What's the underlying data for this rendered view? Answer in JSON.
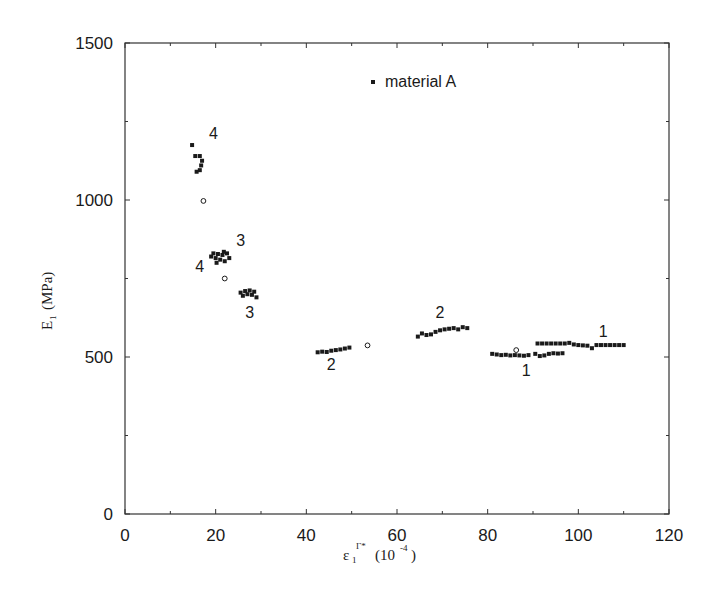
{
  "chart_data": {
    "type": "scatter",
    "title": "",
    "xlabel": "ε1 Γ* (10^-4)",
    "xlabel_parts": {
      "symbol": "ε",
      "sub": "1",
      "sup": "Γ*",
      "unit": "(10",
      "unit_exp": "-4",
      "unit_close": ")"
    },
    "ylabel": "E1 (MPa)",
    "ylabel_parts": {
      "symbol": "E",
      "sub": "1",
      "unit": "(MPa)"
    },
    "xlim": [
      0,
      120
    ],
    "ylim": [
      0,
      1500
    ],
    "x_ticks": [
      0,
      20,
      40,
      60,
      80,
      100,
      120
    ],
    "x_tick_labels": [
      "0",
      "20",
      "40",
      "60",
      "80",
      "100",
      "120"
    ],
    "x_minor_ticks": [
      10,
      30,
      50,
      70,
      90,
      110
    ],
    "y_ticks": [
      0,
      500,
      1000,
      1500
    ],
    "y_tick_labels": [
      "0",
      "500",
      "1000",
      "1500"
    ],
    "y_minor_ticks": [
      250,
      750,
      1250
    ],
    "grid": false,
    "legend": {
      "position": "top-center",
      "entries": [
        {
          "label": "material A",
          "marker": "filled-square"
        }
      ]
    },
    "series": [
      {
        "name": "material A",
        "marker": "filled-square",
        "points": [
          [
            14.8,
            1175
          ],
          [
            15.5,
            1140
          ],
          [
            16.5,
            1140
          ],
          [
            17.0,
            1125
          ],
          [
            16.8,
            1110
          ],
          [
            16.5,
            1095
          ],
          [
            15.8,
            1090
          ],
          [
            19.0,
            820
          ],
          [
            19.5,
            830
          ],
          [
            20.0,
            815
          ],
          [
            20.5,
            828
          ],
          [
            21.0,
            810
          ],
          [
            21.5,
            825
          ],
          [
            22.0,
            805
          ],
          [
            22.5,
            830
          ],
          [
            23.0,
            815
          ],
          [
            20.2,
            800
          ],
          [
            21.8,
            835
          ],
          [
            25.5,
            705
          ],
          [
            26.0,
            695
          ],
          [
            26.5,
            710
          ],
          [
            27.0,
            700
          ],
          [
            27.5,
            712
          ],
          [
            28.0,
            698
          ],
          [
            28.5,
            708
          ],
          [
            29.0,
            690
          ],
          [
            42.5,
            515
          ],
          [
            43.5,
            517
          ],
          [
            44.5,
            516
          ],
          [
            45.5,
            520
          ],
          [
            46.5,
            522
          ],
          [
            47.5,
            524
          ],
          [
            48.5,
            527
          ],
          [
            49.5,
            530
          ],
          [
            64.6,
            565
          ],
          [
            65.5,
            575
          ],
          [
            66.5,
            570
          ],
          [
            67.5,
            572
          ],
          [
            68.5,
            580
          ],
          [
            69.5,
            585
          ],
          [
            70.5,
            588
          ],
          [
            71.5,
            590
          ],
          [
            72.5,
            592
          ],
          [
            73.5,
            588
          ],
          [
            74.5,
            595
          ],
          [
            75.5,
            592
          ],
          [
            81.0,
            510
          ],
          [
            82.0,
            508
          ],
          [
            83.0,
            506
          ],
          [
            84.0,
            507
          ],
          [
            85.0,
            505
          ],
          [
            86.0,
            506
          ],
          [
            87.0,
            505
          ],
          [
            88.0,
            504
          ],
          [
            89.0,
            506
          ],
          [
            90.5,
            510
          ],
          [
            91.5,
            503
          ],
          [
            92.5,
            505
          ],
          [
            93.5,
            510
          ],
          [
            94.5,
            512
          ],
          [
            95.5,
            511
          ],
          [
            96.5,
            512
          ],
          [
            91.0,
            543
          ],
          [
            92.0,
            543
          ],
          [
            93.0,
            543
          ],
          [
            94.0,
            543
          ],
          [
            95.0,
            543
          ],
          [
            96.0,
            543
          ],
          [
            97.0,
            543
          ],
          [
            98.0,
            545
          ],
          [
            99.0,
            540
          ],
          [
            100.0,
            538
          ],
          [
            101.0,
            537
          ],
          [
            102.0,
            536
          ],
          [
            103.0,
            528
          ],
          [
            104.0,
            538
          ],
          [
            105.0,
            538
          ],
          [
            106.0,
            538
          ],
          [
            107.0,
            538
          ],
          [
            108.0,
            538
          ],
          [
            109.0,
            538
          ],
          [
            110.0,
            538
          ]
        ]
      },
      {
        "name": "reference (open circles)",
        "marker": "open-circle",
        "points": [
          [
            17.3,
            997
          ],
          [
            22.0,
            750
          ],
          [
            53.5,
            537
          ],
          [
            86.3,
            522
          ]
        ]
      }
    ],
    "annotations": [
      {
        "text": "4",
        "x": 19.5,
        "y": 1195
      },
      {
        "text": "4",
        "x": 16.5,
        "y": 770
      },
      {
        "text": "3",
        "x": 25.5,
        "y": 855
      },
      {
        "text": "3",
        "x": 27.5,
        "y": 625
      },
      {
        "text": "2",
        "x": 45.5,
        "y": 460
      },
      {
        "text": "2",
        "x": 69.5,
        "y": 625
      },
      {
        "text": "1",
        "x": 88.5,
        "y": 440
      },
      {
        "text": "1",
        "x": 105.5,
        "y": 565
      }
    ]
  },
  "colors": {
    "ink": "#1a1a1a",
    "background": "#ffffff",
    "axis": "#333333"
  }
}
